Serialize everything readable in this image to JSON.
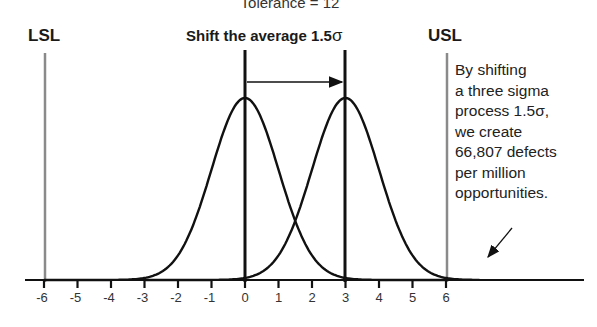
{
  "header": {
    "tolerance_label": "Tolerance = 12",
    "title": "Shift the average 1.5",
    "title_sigma": "σ"
  },
  "limits": {
    "lsl": "LSL",
    "usl": "USL"
  },
  "annotation": {
    "lines": [
      "By shifting",
      "a three sigma",
      "process 1.5σ,",
      "we create",
      "66,807 defects",
      "per million",
      "opportunities."
    ]
  },
  "axis": {
    "ticks": [
      "-6",
      "-5",
      "-4",
      "-3",
      "-2",
      "-1",
      "0",
      "1",
      "2",
      "3",
      "4",
      "5",
      "6"
    ]
  },
  "colors": {
    "curve": "#111111",
    "spec_limit": "#8a8a8a",
    "mean_line": "#111111",
    "background": "#ffffff"
  },
  "chart_data": {
    "type": "line",
    "title": "Shift the average 1.5σ",
    "subtitle": "Tolerance = 12",
    "xlabel": "",
    "ylabel": "",
    "x_ticks": [
      -6,
      -5,
      -4,
      -3,
      -2,
      -1,
      0,
      1,
      2,
      3,
      4,
      5,
      6
    ],
    "xlim": [
      -6.5,
      7.2
    ],
    "series": [
      {
        "name": "Original process",
        "distribution": "normal",
        "mean": 0,
        "sigma": 1,
        "x_range": [
          -6,
          6
        ]
      },
      {
        "name": "Shifted process",
        "distribution": "normal",
        "mean": 3,
        "sigma": 1,
        "x_range": [
          -3,
          7
        ]
      }
    ],
    "vertical_lines": [
      {
        "label": "LSL",
        "x": -6,
        "style": "gray"
      },
      {
        "label": "USL",
        "x": 6,
        "style": "gray"
      },
      {
        "label": "mean",
        "x": 0,
        "style": "black"
      },
      {
        "label": "shifted mean",
        "x": 3,
        "style": "black"
      }
    ],
    "annotations": [
      {
        "type": "arrow",
        "from": 0,
        "to": 3,
        "text": "shift"
      },
      {
        "type": "hatched_area",
        "from": 6,
        "to": 7,
        "text": "By shifting a three sigma process 1.5σ, we create 66,807 defects per million opportunities."
      }
    ],
    "grid": false
  }
}
